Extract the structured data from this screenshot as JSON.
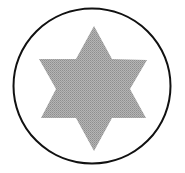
{
  "figure": {
    "circle": {
      "cx": 92,
      "cy": 86,
      "rx": 78.5,
      "ry": 77.5,
      "stroke": "#111111",
      "stroke_width": 2,
      "fill": "#ffffff"
    },
    "star": {
      "fill": "#a3a3a3",
      "points": "94,26 112,59 147,60 130,89 146,118 112,118 94,151 76,118 41,118 56,89 39,59 76,59"
    }
  }
}
